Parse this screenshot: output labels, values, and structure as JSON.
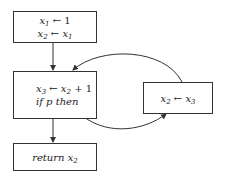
{
  "diagram": {
    "type": "control-flow-graph",
    "nodes": [
      {
        "id": "entry",
        "lines": [
          {
            "var": "x",
            "sub": "1",
            "op": " ← ",
            "rhs": "1",
            "rhs_sub": ""
          },
          {
            "var": "x",
            "sub": "2",
            "op": " ← ",
            "rhs": "x",
            "rhs_sub": "1"
          }
        ]
      },
      {
        "id": "loop-header",
        "lines": [
          {
            "var": "x",
            "sub": "3",
            "op": " ← ",
            "rhs": "x",
            "rhs_sub": "2",
            "tail": " + 1"
          },
          {
            "text": "if p then"
          }
        ]
      },
      {
        "id": "loop-body",
        "lines": [
          {
            "var": "x",
            "sub": "2",
            "op": " ← ",
            "rhs": "x",
            "rhs_sub": "3"
          }
        ]
      },
      {
        "id": "exit",
        "lines": [
          {
            "text": "return x",
            "text_sub": "2"
          }
        ]
      }
    ],
    "edges": [
      {
        "from": "entry",
        "to": "loop-header"
      },
      {
        "from": "loop-header",
        "to": "loop-body"
      },
      {
        "from": "loop-body",
        "to": "loop-header"
      },
      {
        "from": "loop-header",
        "to": "exit"
      }
    ],
    "stroke_color": "#333333"
  }
}
